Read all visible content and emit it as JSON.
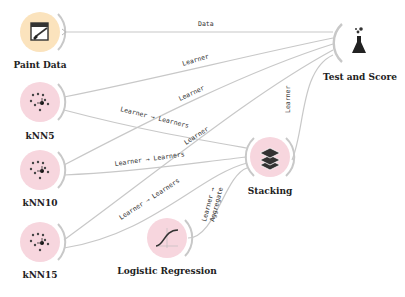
{
  "colors": {
    "data_node": "#fbe3bd",
    "model_node": "#f7d6de",
    "eval_node": "#ffffff",
    "link": "#c8c8c8",
    "anchor": "#b8b8b8"
  },
  "nodes": [
    {
      "id": "paint-data",
      "label": "Paint Data",
      "icon": "paint-data-icon"
    },
    {
      "id": "knn5",
      "label": "kNN5",
      "icon": "knn-icon"
    },
    {
      "id": "knn10",
      "label": "kNN10",
      "icon": "knn-icon"
    },
    {
      "id": "knn15",
      "label": "kNN15",
      "icon": "knn-icon"
    },
    {
      "id": "logistic-regression",
      "label": "Logistic Regression",
      "icon": "logistic-regression-icon"
    },
    {
      "id": "stacking",
      "label": "Stacking",
      "icon": "stacking-icon"
    },
    {
      "id": "test-and-score",
      "label": "Test and Score",
      "icon": "test-and-score-icon"
    }
  ],
  "links": [
    {
      "from": "Paint Data",
      "to": "Test and Score",
      "label": "Data"
    },
    {
      "from": "kNN5",
      "to": "Test and Score",
      "label": "Learner"
    },
    {
      "from": "kNN10",
      "to": "Test and Score",
      "label": "Learner"
    },
    {
      "from": "kNN15",
      "to": "Test and Score",
      "label": "Learner"
    },
    {
      "from": "kNN5",
      "to": "Stacking",
      "label": "Learner → Learners"
    },
    {
      "from": "kNN10",
      "to": "Stacking",
      "label": "Learner → Learners"
    },
    {
      "from": "kNN15",
      "to": "Stacking",
      "label": "Learner → Learners"
    },
    {
      "from": "Logistic Regression",
      "to": "Stacking",
      "label": "Learner → Aggregate"
    },
    {
      "from": "Stacking",
      "to": "Test and Score",
      "label": "Learner"
    }
  ],
  "link_labels": {
    "data": "Data",
    "learner": "Learner",
    "learner_learners": "Learner → Learners",
    "learner_arrow": "Learner →",
    "aggregate": "Aggregate"
  }
}
